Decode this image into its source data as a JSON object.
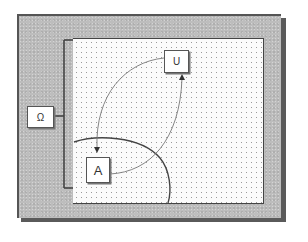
{
  "diagram": {
    "type": "set-relation-diagram",
    "labels": {
      "omega": "Ω",
      "u": "U",
      "a": "A"
    },
    "elements": {
      "frame": "outer-frame",
      "panel": "dotted-universe-region",
      "bracket": "omega-bracket",
      "ellipse": "set-boundary-arc",
      "arrow_u_to_a": "curved-arrow U to A",
      "arrow_a_to_u": "curved-arrow A to U"
    },
    "colors": {
      "frame": "#bdbdbd",
      "frame_shadow": "#5a5a5a",
      "panel": "#fbfbfb",
      "dots": "#9a9a9a",
      "lines": "#444444",
      "thin_curves": "#666666"
    }
  }
}
